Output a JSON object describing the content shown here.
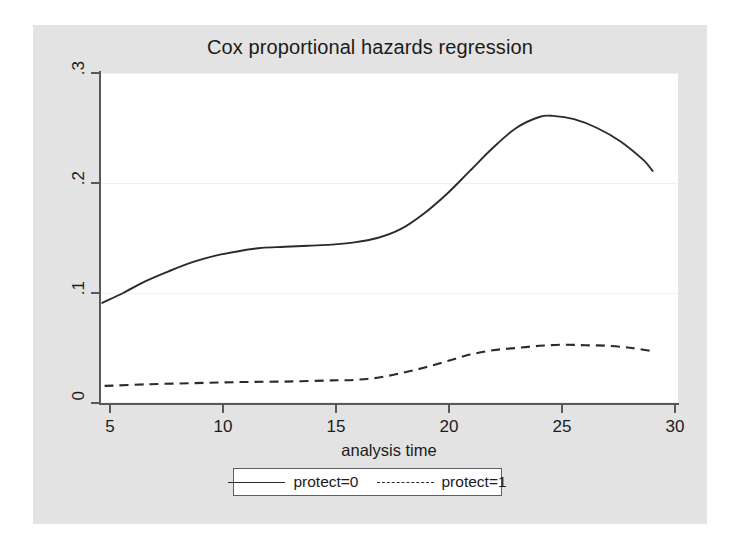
{
  "figure": {
    "background_color": "#e3e3e3",
    "plot_background_color": "#ffffff",
    "axis_color": "#55585c",
    "line_color": "#2b2b2b"
  },
  "chart_data": {
    "type": "line",
    "title": "Cox proportional hazards regression",
    "xlabel": "analysis time",
    "ylabel": "Smoothed hazard function",
    "xlim": [
      5,
      30
    ],
    "ylim": [
      0,
      0.3
    ],
    "xticks": [
      "5",
      "10",
      "15",
      "20",
      "25",
      "30"
    ],
    "xtick_values": [
      5,
      10,
      15,
      20,
      25,
      30
    ],
    "yticks": [
      "0",
      ".1",
      ".2",
      ".3"
    ],
    "ytick_values": [
      0,
      0.1,
      0.2,
      0.3
    ],
    "grid": "horizontal",
    "legend_position": "below-axis",
    "series": [
      {
        "name": "protect=0",
        "style": "solid",
        "x": [
          5.1,
          6,
          7,
          8,
          9,
          10,
          11,
          12,
          13,
          14,
          15,
          16,
          17,
          18,
          19,
          20,
          21,
          22,
          23,
          24,
          24.6,
          25.5,
          26.5,
          27.5,
          28.5,
          28.9
        ],
        "values": [
          0.091,
          0.1,
          0.111,
          0.12,
          0.128,
          0.134,
          0.138,
          0.141,
          0.142,
          0.143,
          0.144,
          0.146,
          0.15,
          0.158,
          0.172,
          0.19,
          0.211,
          0.232,
          0.25,
          0.26,
          0.261,
          0.258,
          0.25,
          0.238,
          0.221,
          0.211
        ]
      },
      {
        "name": "protect=1",
        "style": "dashed",
        "x": [
          5.2,
          7,
          9,
          11,
          13,
          15,
          16,
          17,
          18,
          19,
          20,
          21,
          22,
          23,
          24,
          25,
          26,
          27,
          28,
          28.9
        ],
        "values": [
          0.0155,
          0.017,
          0.018,
          0.019,
          0.0195,
          0.0205,
          0.021,
          0.023,
          0.027,
          0.032,
          0.038,
          0.044,
          0.048,
          0.05,
          0.052,
          0.053,
          0.0525,
          0.052,
          0.05,
          0.047
        ]
      }
    ]
  },
  "legend": {
    "entries": [
      {
        "label": "protect=0",
        "style": "solid"
      },
      {
        "label": "protect=1",
        "style": "dashed"
      }
    ]
  }
}
